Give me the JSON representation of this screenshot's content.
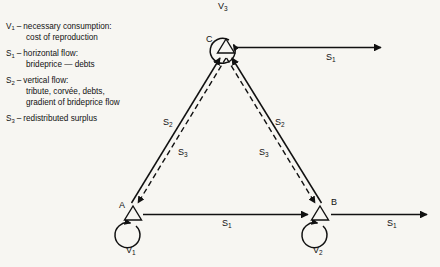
{
  "figure": {
    "background_color": "#f7f6f2",
    "ink_color": "#111111",
    "type": "directed-graph-diagram"
  },
  "legend": {
    "entries": [
      {
        "symbol": "V",
        "sub": "1",
        "dash": "–",
        "head": "necessary consumption:",
        "sub_lines": [
          "cost of reproduction"
        ]
      },
      {
        "symbol": "S",
        "sub": "1",
        "dash": "–",
        "head": "horizontal flow:",
        "sub_lines": [
          "brideprice — debts"
        ]
      },
      {
        "symbol": "S",
        "sub": "2",
        "dash": "–",
        "head": "vertical flow:",
        "sub_lines": [
          "tribute, corvée, debts,",
          "gradient of brideprice flow"
        ]
      },
      {
        "symbol": "S",
        "sub": "3",
        "dash": "–",
        "head": "redistributed surplus",
        "sub_lines": []
      }
    ]
  },
  "nodes": [
    {
      "id": "A",
      "label": "A",
      "x": 133,
      "y": 215,
      "loop_label": "V",
      "loop_sub": "1",
      "loop_side": "below"
    },
    {
      "id": "B",
      "label": "B",
      "x": 320,
      "y": 215,
      "loop_label": "V",
      "loop_sub": "2",
      "loop_side": "below"
    },
    {
      "id": "C",
      "label": "C",
      "x": 226,
      "y": 47,
      "loop_label": "V",
      "loop_sub": "3",
      "loop_side": "above"
    }
  ],
  "edges": [
    {
      "from": "A",
      "to": "B",
      "style": "solid",
      "label": "S",
      "label_sub": "1",
      "orientation": "horizontal"
    },
    {
      "from": "A",
      "to": "C",
      "style": "solid",
      "label": "S",
      "label_sub": "2",
      "orientation": "diagonal"
    },
    {
      "from": "C",
      "to": "A",
      "style": "dashed",
      "label": "S",
      "label_sub": "3",
      "orientation": "diagonal"
    },
    {
      "from": "B",
      "to": "C",
      "style": "solid",
      "label": "S",
      "label_sub": "2",
      "orientation": "diagonal"
    },
    {
      "from": "C",
      "to": "B",
      "style": "dashed",
      "label": "S",
      "label_sub": "3",
      "orientation": "diagonal"
    },
    {
      "from": "C",
      "to": "outside-right",
      "style": "solid",
      "label": "S",
      "label_sub": "1",
      "orientation": "horizontal"
    },
    {
      "from": "B",
      "to": "outside-right",
      "style": "solid",
      "label": "S",
      "label_sub": "1",
      "orientation": "horizontal"
    }
  ],
  "edge_labels": {
    "top_s1": {
      "text": "S",
      "sub": "1",
      "x": 331,
      "y": 48
    },
    "bottom_s1": {
      "text": "S",
      "sub": "1",
      "x": 228,
      "y": 221
    },
    "right_s1": {
      "text": "S",
      "sub": "1",
      "x": 392,
      "y": 221
    },
    "left_s2": {
      "text": "S",
      "sub": "2",
      "x": 169,
      "y": 123
    },
    "left_s3": {
      "text": "S",
      "sub": "3",
      "x": 183,
      "y": 153
    },
    "right_s2": {
      "text": "S",
      "sub": "2",
      "x": 280,
      "y": 123
    },
    "right_s3": {
      "text": "S",
      "sub": "3",
      "x": 265,
      "y": 153
    }
  },
  "node_labels": {
    "A": {
      "text": "A",
      "x": 120,
      "y": 206
    },
    "B": {
      "text": "B",
      "x": 330,
      "y": 203
    },
    "C": {
      "text": "C",
      "x": 208,
      "y": 40
    }
  },
  "loop_labels": {
    "v1": {
      "text": "V",
      "sub": "1",
      "x": 128,
      "y": 248
    },
    "v2": {
      "text": "V",
      "sub": "2",
      "x": 315,
      "y": 248
    },
    "v3": {
      "text": "V",
      "sub": "3",
      "x": 220,
      "y": 2
    }
  }
}
